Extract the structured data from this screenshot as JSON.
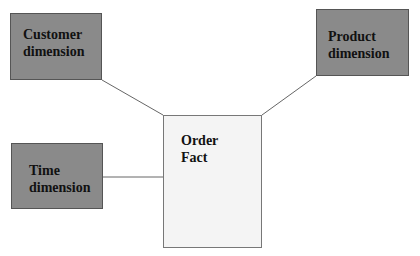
{
  "diagram": {
    "type": "star-schema",
    "nodes": {
      "customer": {
        "line1": "Customer",
        "line2": "dimension",
        "kind": "dimension"
      },
      "product": {
        "line1": "Product",
        "line2": "dimension",
        "kind": "dimension"
      },
      "time": {
        "line1": "Time",
        "line2": "dimension",
        "kind": "dimension"
      },
      "fact": {
        "line1": "Order",
        "line2": "Fact",
        "kind": "fact"
      }
    },
    "edges": [
      {
        "from": "customer",
        "to": "fact"
      },
      {
        "from": "product",
        "to": "fact"
      },
      {
        "from": "time",
        "to": "fact"
      }
    ],
    "colors": {
      "dimension_fill": "#8a8a8a",
      "fact_fill": "#f4f4f4",
      "edge": "#666666"
    }
  }
}
